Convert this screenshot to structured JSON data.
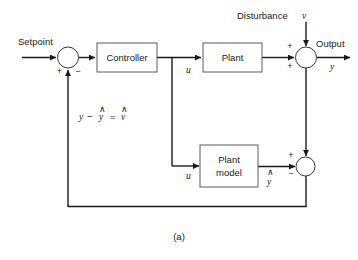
{
  "figure": {
    "caption": "(a)",
    "type": "control-system-block-diagram"
  },
  "blocks": {
    "controller": {
      "label": "Controller"
    },
    "plant": {
      "label": "Plant"
    },
    "plant_model": {
      "label_line1": "Plant",
      "label_line2": "model"
    }
  },
  "labels": {
    "setpoint": "Setpoint",
    "disturbance": "Disturbance",
    "output": "Output"
  },
  "signals": {
    "control_upper": "u",
    "control_lower": "u",
    "disturbance_var": "v",
    "output_var": "y",
    "model_output": "y",
    "error_expr_y": "y",
    "error_expr_minus": "−",
    "error_expr_yhat": "y",
    "error_expr_equals": "=",
    "error_expr_vhat": "v",
    "hat_mark": "∧"
  },
  "summing_junctions": {
    "setpoint_junction": {
      "sign_left": "+",
      "sign_right": "−"
    },
    "output_junction": {
      "sign_top": "+",
      "sign_bottom": "+"
    },
    "model_error_junction": {
      "sign_top": "+",
      "sign_bottom": "−"
    }
  },
  "colors": {
    "wire": "#1a1a1a",
    "block_stroke": "#5a5a5a",
    "background": "#ffffff",
    "text": "#1a1a1a"
  }
}
